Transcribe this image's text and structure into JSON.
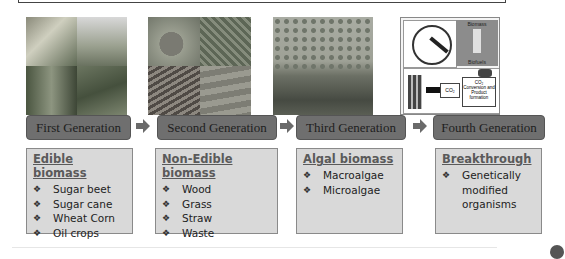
{
  "diagram": {
    "generations": [
      {
        "label": "First Generation",
        "image": "sugarcane-and-crops-photo",
        "category": "Edible biomass",
        "items": [
          "Sugar beet",
          "Sugar cane",
          "Wheat Corn",
          "Oil crops"
        ]
      },
      {
        "label": "Second Generation",
        "image": "wood-grass-straw-waste-photo",
        "category": "Non-Edible biomass",
        "items": [
          "Wood",
          "Grass",
          "Straw",
          "Waste"
        ]
      },
      {
        "label": "Third Generation",
        "image": "algae-photo",
        "category": "Algal biomass",
        "items": [
          "Macroalgae",
          "Microalgae"
        ]
      },
      {
        "label": "Fourth Generation",
        "image": "genetic-engineering-and-co2-conversion-illustration",
        "category": "Breakthrough",
        "items": [
          "Genetically modified organisms"
        ]
      }
    ],
    "fourth_gen_illustration": {
      "top_right_top": "Biomass",
      "top_right_middle": "Feedstock",
      "top_right_bottom": "Biofuels",
      "co2_left": "CO₂",
      "co2_right_title": "CO₂",
      "co2_right_text": "Conversion and Product formation"
    },
    "bullet_glyph": "❖",
    "colors": {
      "label_bg": "#6f6f6f",
      "box_bg": "#d9d9d9",
      "heading": "#5a5a5a",
      "arrow": "#6a6a6a"
    }
  }
}
